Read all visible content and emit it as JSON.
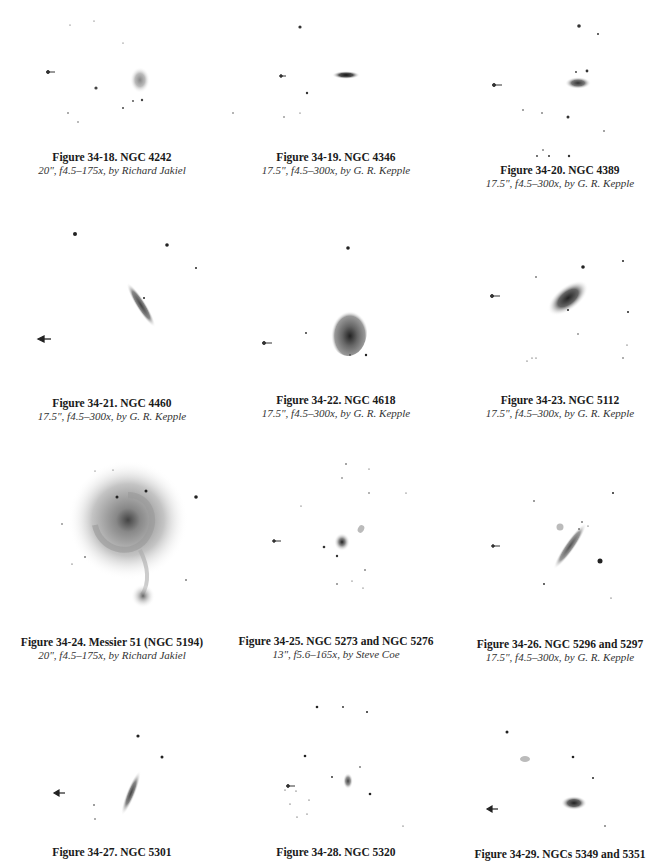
{
  "figures": [
    {
      "title": "Figure 34-18. NGC 4242",
      "subtitle": "20\", f4.5–175x, by Richard Jakiel"
    },
    {
      "title": "Figure 34-19. NGC 4346",
      "subtitle": "17.5\", f4.5–300x, by G. R. Kepple"
    },
    {
      "title": "Figure 34-20. NGC 4389",
      "subtitle": "17.5\", f4.5–300x, by G. R. Kepple"
    },
    {
      "title": "Figure 34-21. NGC 4460",
      "subtitle": "17.5\", f4.5–300x, by G. R. Kepple"
    },
    {
      "title": "Figure 34-22. NGC 4618",
      "subtitle": "17.5\", f4.5–300x, by G. R. Kepple"
    },
    {
      "title": "Figure 34-23. NGC 5112",
      "subtitle": "17.5\", f4.5–300x, by G. R. Kepple"
    },
    {
      "title": "Figure 34-24. Messier 51 (NGC 5194)",
      "subtitle": "20\", f4.5–175x, by Richard Jakiel"
    },
    {
      "title": "Figure 34-25. NGC 5273 and NGC 5276",
      "subtitle": "13\", f5.6–165x, by Steve Coe"
    },
    {
      "title": "Figure 34-26. NGC 5296 and 5297",
      "subtitle": "17.5\", f4.5–300x, by G. R. Kepple"
    },
    {
      "title": "Figure 34-27. NGC 5301",
      "subtitle": ""
    },
    {
      "title": "Figure 34-28. NGC 5320",
      "subtitle": ""
    },
    {
      "title": "Figure 34-29. NGCs 5349 and 5351",
      "subtitle": ""
    }
  ]
}
